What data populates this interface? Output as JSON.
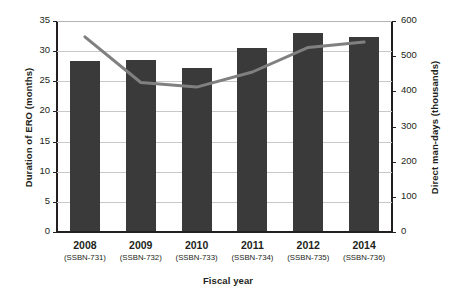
{
  "chart_data": {
    "type": "bar",
    "title": "",
    "xlabel": "Fiscal year",
    "ylabel": "Duration of ERO (months)",
    "y2label": "Direct man-days (thousands)",
    "categories": [
      "2008",
      "2009",
      "2010",
      "2011",
      "2012",
      "2014"
    ],
    "category_sublabels": [
      "(SSBN-731)",
      "(SSBN-732)",
      "(SSBN-733)",
      "(SSBN-734)",
      "(SSBN-735)",
      "(SSBN-736)"
    ],
    "ylim": [
      0,
      35
    ],
    "y2lim": [
      0,
      600
    ],
    "yticks": [
      0,
      5,
      10,
      15,
      20,
      25,
      30,
      35
    ],
    "y2ticks": [
      0,
      100,
      200,
      300,
      400,
      500,
      600
    ],
    "grid": "horizontal",
    "legend": "none",
    "series": [
      {
        "name": "Duration of ERO (months)",
        "type": "bar",
        "axis": "left",
        "color": "#3a3a3a",
        "values": [
          28.2,
          28.3,
          27.0,
          30.3,
          32.8,
          32.2
        ]
      },
      {
        "name": "Direct man-days (thousands)",
        "type": "line",
        "axis": "right",
        "color": "#808080",
        "values": [
          555,
          425,
          412,
          455,
          525,
          540
        ]
      }
    ]
  }
}
